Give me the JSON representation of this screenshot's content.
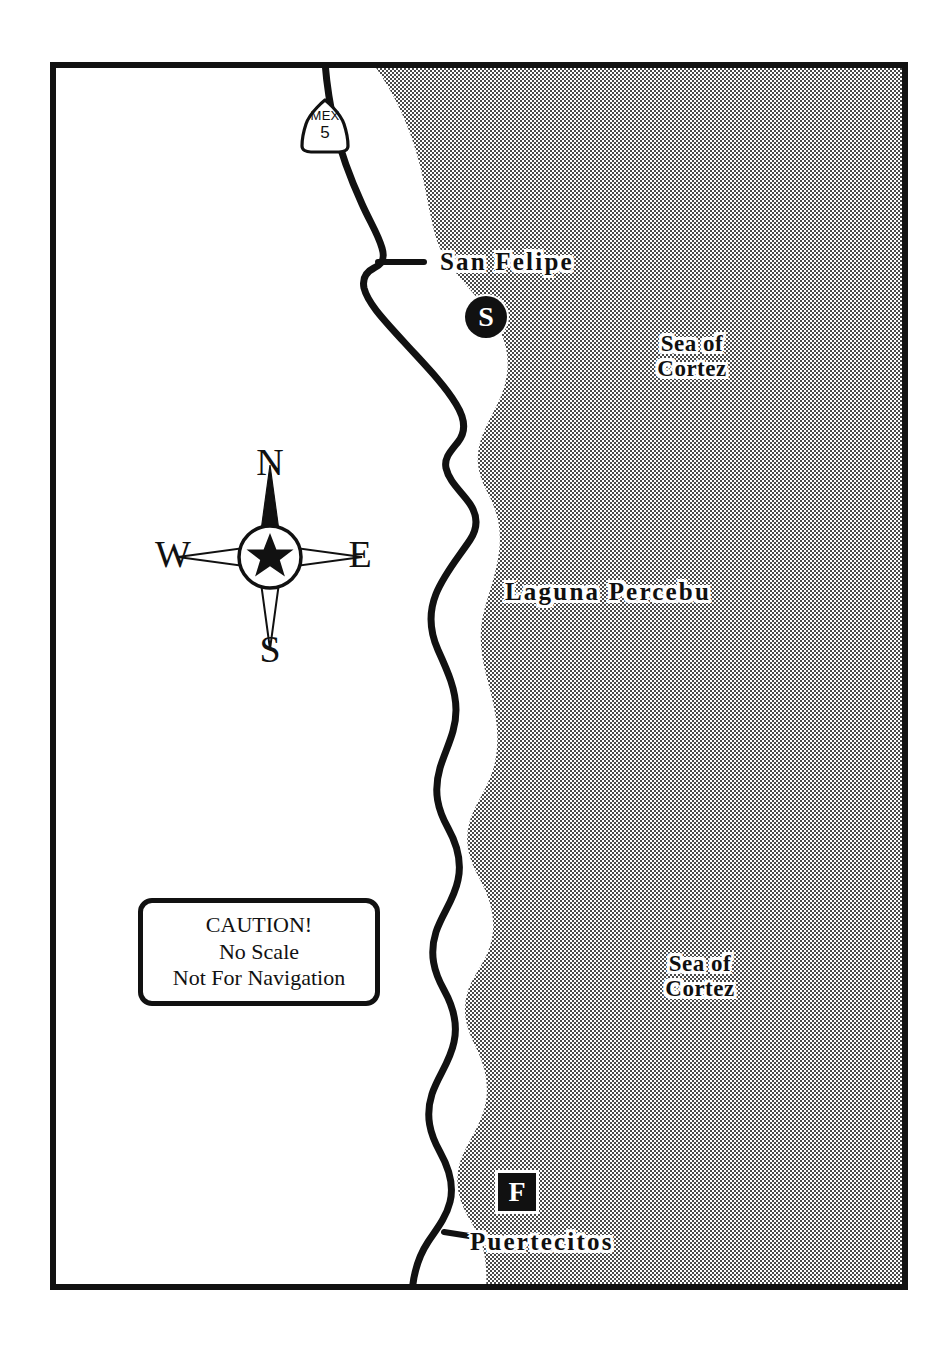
{
  "map": {
    "title": "Baja California Coast Map",
    "colors": {
      "sea_fill": "#9a9a9a",
      "land_fill": "#ffffff",
      "ink": "#111111",
      "halo": "#ffffff"
    },
    "frame": {
      "x": 50,
      "y": 62,
      "width": 858,
      "height": 1228,
      "stroke_width": 6
    },
    "water_labels": [
      {
        "id": "sea-cortez-1",
        "lines": [
          "Sea of",
          "Cortez"
        ],
        "text": "Sea of Cortez"
      },
      {
        "id": "sea-cortez-2",
        "lines": [
          "Sea of",
          "Cortez"
        ],
        "text": "Sea of Cortez"
      },
      {
        "id": "laguna-percebu",
        "text": "Laguna Percebu"
      }
    ],
    "place_labels": [
      {
        "id": "san-felipe",
        "text": "San Felipe",
        "marker": "S",
        "marker_shape": "circle"
      },
      {
        "id": "puertecitos",
        "text": "Puertecitos",
        "marker": "F",
        "marker_shape": "square"
      }
    ],
    "sea_of_cortez_line1": "Sea of",
    "sea_of_cortez_line2": "Cortez",
    "laguna_percebu": "Laguna Percebu",
    "san_felipe": "San Felipe",
    "puertecitos": "Puertecitos",
    "san_felipe_marker": "S",
    "puertecitos_marker": "F",
    "highway": {
      "id": "mex-5",
      "prefix": "MEX",
      "number": "5",
      "shield_type": "mexico-federal-highway"
    },
    "compass": {
      "north": "N",
      "south": "S",
      "east": "E",
      "west": "W",
      "center_symbol": "star"
    },
    "caution": {
      "line1": "CAUTION!",
      "line2": "No Scale",
      "line3": "Not For Navigation"
    }
  }
}
